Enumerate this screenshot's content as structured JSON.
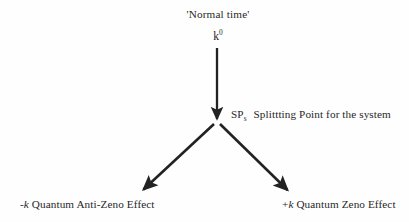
{
  "diagram": {
    "background_color": "#fefefe",
    "ink_color": "#272727",
    "title_top": "'Normal time'",
    "nodes": {
      "source": {
        "label_prefix": "k",
        "label_superscript": "0",
        "full_text": "k0"
      },
      "split": {
        "abbrev": "SP",
        "subscript": "s",
        "description": "Splittting Point for the system",
        "full_text": "SPs  Splittting Point for the system"
      },
      "left_outcome": {
        "sign": "-",
        "symbol": "k",
        "description": "Quantum Anti-Zeno Effect",
        "full_text": "-k Quantum Anti-Zeno Effect"
      },
      "right_outcome": {
        "sign": "+",
        "symbol": "k",
        "description": "Quantum Zeno Effect",
        "full_text": "+k Quantum Zeno Effect"
      }
    },
    "arrows": [
      {
        "name": "vertical-arrow-to-split-point",
        "from_x": 217,
        "from_y": 48,
        "to_x": 217,
        "to_y": 122
      },
      {
        "name": "branch-arrow-left-anti-zeno",
        "from_x": 214,
        "from_y": 123,
        "to_x": 140,
        "to_y": 192
      },
      {
        "name": "branch-arrow-right-zeno",
        "from_x": 220,
        "from_y": 123,
        "to_x": 291,
        "to_y": 193
      }
    ]
  }
}
